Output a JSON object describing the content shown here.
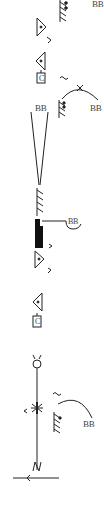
{
  "diagram": {
    "type": "movement-notation-score",
    "labels": {
      "top_right": "BB",
      "arc_right": "BB",
      "v_top": "BB",
      "hook": "BB",
      "lower_arc": "BB"
    },
    "symbols": [
      {
        "name": "hatched-support-with-dots",
        "y": 0
      },
      {
        "name": "triangle-right-with-dot",
        "y": 18
      },
      {
        "name": "chevron-right",
        "y": 38
      },
      {
        "name": "triangle-left-with-dot",
        "y": 52
      },
      {
        "name": "box-c",
        "text": "C",
        "y": 71
      },
      {
        "name": "wave",
        "y": 76
      },
      {
        "name": "arc-with-cross",
        "y": 84
      },
      {
        "name": "hatched-support-with-dots",
        "y": 99
      },
      {
        "name": "v-lines",
        "y": 110
      },
      {
        "name": "hatched-support",
        "y": 188
      },
      {
        "name": "black-block-with-hook",
        "y": 220
      },
      {
        "name": "chevron-right",
        "y": 243
      },
      {
        "name": "triangle-right-with-dot",
        "y": 251
      },
      {
        "name": "chevron-right",
        "y": 269
      },
      {
        "name": "triangle-left-with-dot",
        "y": 294
      },
      {
        "name": "box-c",
        "text": "C",
        "y": 315
      },
      {
        "name": "ring-with-horns",
        "y": 355
      },
      {
        "name": "asterisk-on-line",
        "y": 400
      },
      {
        "name": "wave",
        "y": 394
      },
      {
        "name": "hatched-support-with-dot",
        "y": 408
      },
      {
        "name": "lower-arc",
        "y": 398
      },
      {
        "name": "zigzag-on-line",
        "y": 460
      },
      {
        "name": "arrow-left-line",
        "y": 478
      }
    ],
    "colors": {
      "ink": "#222222",
      "label": "#555555",
      "background": "#ffffff"
    }
  }
}
